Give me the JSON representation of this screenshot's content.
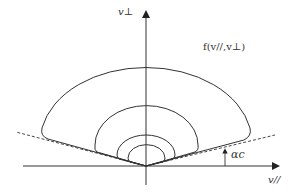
{
  "diagram": {
    "type": "velocity-space distribution contours (loss cone)",
    "axes": {
      "vertical_label": "v⊥",
      "horizontal_label": "v//"
    },
    "function_label": "f(v//,v⊥)",
    "angle_label": "αc",
    "contours": 4,
    "loss_cone_boundary": "dashed lines at angle αc from horizontal axis"
  }
}
